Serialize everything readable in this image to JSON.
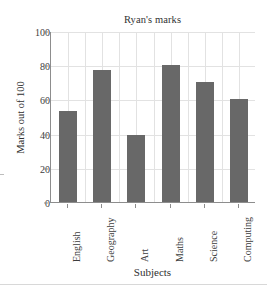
{
  "chart_data": {
    "type": "bar",
    "title": "Ryan's marks",
    "xlabel": "Subjects",
    "ylabel": "Marks out of 100",
    "categories": [
      "English",
      "Geography",
      "Art",
      "Maths",
      "Science",
      "Computing"
    ],
    "values": [
      53,
      77,
      39,
      80,
      70,
      60
    ],
    "ylim": [
      0,
      100
    ],
    "yticks": [
      0,
      20,
      40,
      60,
      80,
      100
    ],
    "ytick_labels": [
      "0",
      "20",
      "40",
      "60",
      "80",
      "100"
    ],
    "grid": true,
    "grid_orientation": "both",
    "legend": false,
    "bar_color": "#686868",
    "grid_color": "#e2e2e2",
    "axis_color": "#8d8d8d",
    "series": [
      {
        "name": "Ryan's marks",
        "values": [
          53,
          77,
          39,
          80,
          70,
          60
        ]
      }
    ]
  }
}
